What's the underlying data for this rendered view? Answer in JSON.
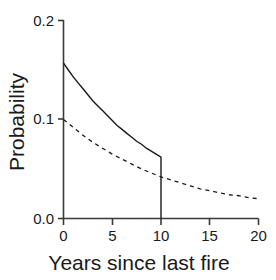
{
  "chart_data": {
    "type": "line",
    "title": "",
    "subtitle": "",
    "xlabel": "Years since last fire",
    "ylabel": "Probability",
    "xlim": [
      0,
      20
    ],
    "ylim": [
      0.0,
      0.2
    ],
    "xticks": [
      0,
      5,
      10,
      15,
      20
    ],
    "xtick_labels": [
      "0",
      "5",
      "10",
      "15",
      "20"
    ],
    "yticks": [
      0.0,
      0.1,
      0.2
    ],
    "ytick_labels": [
      "0.0",
      "0.1",
      "0.2"
    ],
    "grid": false,
    "legend": null,
    "legend_position": "none",
    "annotations": [],
    "series": [
      {
        "name": "solid-curve",
        "style": "solid",
        "color": "#1a1a1a",
        "linewidth": 1.3,
        "x": [
          0,
          0.5,
          1,
          1.5,
          2,
          2.5,
          3,
          3.5,
          4,
          4.5,
          5,
          5.5,
          6,
          6.5,
          7,
          7.5,
          8,
          8.5,
          9,
          9.5,
          10,
          10,
          10
        ],
        "values": [
          0.157,
          0.15,
          0.143,
          0.137,
          0.131,
          0.125,
          0.119,
          0.114,
          0.109,
          0.104,
          0.099,
          0.094,
          0.09,
          0.086,
          0.082,
          0.078,
          0.075,
          0.071,
          0.068,
          0.065,
          0.062,
          0.062,
          0.0
        ],
        "note": "declining curve truncated with vertical drop to zero at x = 10"
      },
      {
        "name": "dashed-curve",
        "style": "dashed",
        "color": "#1a1a1a",
        "linewidth": 1.3,
        "dash_pattern": "4,4",
        "x": [
          0,
          1,
          2,
          3,
          4,
          5,
          6,
          7,
          8,
          9,
          10,
          11,
          12,
          13,
          14,
          15,
          16,
          17,
          18,
          19,
          20
        ],
        "values": [
          0.1,
          0.092,
          0.084,
          0.077,
          0.071,
          0.065,
          0.06,
          0.055,
          0.05,
          0.046,
          0.042,
          0.039,
          0.036,
          0.033,
          0.03,
          0.028,
          0.026,
          0.024,
          0.023,
          0.021,
          0.02
        ]
      }
    ]
  },
  "axes": {
    "y_title": "Probability",
    "x_title": "Years since last fire",
    "y_tick_0": "0.0",
    "y_tick_1": "0.1",
    "y_tick_2": "0.2",
    "x_tick_0": "0",
    "x_tick_1": "5",
    "x_tick_2": "10",
    "x_tick_3": "15",
    "x_tick_4": "20"
  },
  "colors": {
    "axis": "#3a3a3a",
    "curve": "#1a1a1a",
    "background": "#ffffff"
  }
}
